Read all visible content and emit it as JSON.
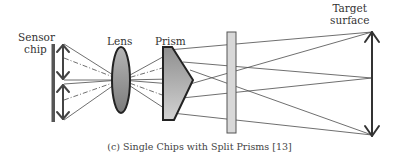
{
  "labels": {
    "sensor_line1": "Sensor",
    "sensor_line2": "chip",
    "lens": "Lens",
    "prism": "Prism",
    "target_line1": "Target",
    "target_line2": "surface"
  },
  "caption": "(c) Single Chips with Split Prisms [13]",
  "colors": {
    "stroke": "#333333",
    "sensor": "#555555",
    "lens_fill_top": "#b8b8b8",
    "lens_fill_bottom": "#7a7a7a",
    "prism_fill_top": "#9a9a9a",
    "prism_fill_bottom": "#d0d0d0",
    "plate_fill": "#d8d8d8"
  }
}
